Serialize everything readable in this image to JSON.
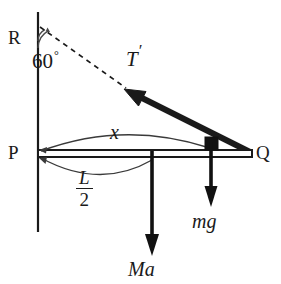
{
  "figure": {
    "kind": "physics-free-body-diagram",
    "background_color": "#ffffff",
    "ink_color": "#1a1a1a",
    "labels": {
      "wall_top_point": "R",
      "hinge_point": "P",
      "rod_end_point": "Q",
      "angle_value": "60",
      "angle_unit": "°",
      "tension": "T",
      "tension_prime": "′",
      "distance_x": "x",
      "weight": "mg",
      "inertial_force": "Ma",
      "half_length_numerator": "L",
      "half_length_denominator": "2"
    },
    "geometry": {
      "wall_x": 38,
      "wall_y_top": 12,
      "wall_y_bottom": 232,
      "rod_y_top": 150,
      "rod_y_bottom": 157,
      "rod_x_left": 38,
      "rod_x_right": 252,
      "block_x": 211,
      "block_size": 13,
      "ma_arrow_x": 152,
      "mg_arrow_x": 211,
      "tension_angle_deg": 60
    }
  }
}
